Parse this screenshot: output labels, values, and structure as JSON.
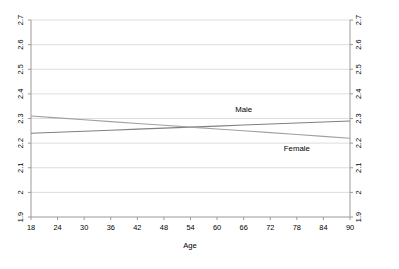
{
  "chart_data": {
    "type": "line",
    "title": "",
    "xlabel": "Age",
    "ylabel": "",
    "x": [
      18,
      24,
      30,
      36,
      42,
      48,
      54,
      60,
      66,
      72,
      78,
      84,
      90
    ],
    "xtick_labels": [
      "18",
      "24",
      "30",
      "36",
      "42",
      "48",
      "54",
      "60",
      "66",
      "72",
      "78",
      "84",
      "90"
    ],
    "xlim": [
      18,
      90
    ],
    "ylim": [
      1.9,
      2.7
    ],
    "ytick_labels": [
      "1.9",
      "2",
      "2.1",
      "2.2",
      "2.3",
      "2.4",
      "2.5",
      "2.6",
      "2.7"
    ],
    "ytick_values": [
      1.9,
      2.0,
      2.1,
      2.2,
      2.3,
      2.4,
      2.5,
      2.6,
      2.7
    ],
    "right_axis_tick_labels": [
      "1.9",
      "2",
      "2.1",
      "2.2",
      "2.3",
      "2.4",
      "2.5",
      "2.6",
      "2.7"
    ],
    "grid": true,
    "grid_axis": "y",
    "legend_position": "inline-annotations",
    "series": [
      {
        "name": "Male",
        "color": "#808080",
        "values": [
          2.24,
          2.2442,
          2.2483,
          2.2525,
          2.2567,
          2.2608,
          2.265,
          2.2692,
          2.2733,
          2.2775,
          2.2817,
          2.2858,
          2.29
        ]
      },
      {
        "name": "Female",
        "color": "#A0A0A0",
        "values": [
          2.31,
          2.3025,
          2.295,
          2.2875,
          2.28,
          2.2725,
          2.265,
          2.2575,
          2.25,
          2.2425,
          2.235,
          2.2275,
          2.22
        ]
      }
    ],
    "annotations": [
      {
        "text": "Male",
        "x": 66,
        "y": 2.325
      },
      {
        "text": "Female",
        "x": 78,
        "y": 2.168
      }
    ]
  },
  "axes": {
    "left_axis_name": "left-y-axis",
    "right_axis_name": "right-y-axis",
    "bottom_axis_name": "x-axis"
  }
}
